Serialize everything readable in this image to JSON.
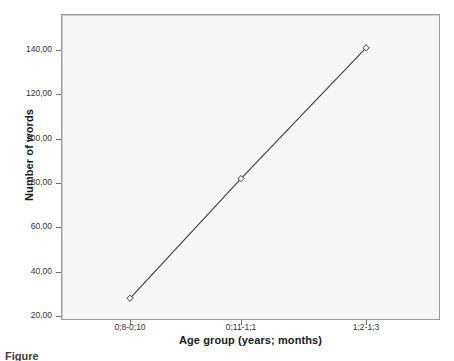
{
  "figure": {
    "background_color": "#ffffff",
    "plot_background_color": "#f7f7f7",
    "frame_color": "#9a9a9a",
    "series_color": "#3c3c3c",
    "caption_partial": "Figure"
  },
  "chart_data": {
    "type": "line",
    "title": "",
    "xlabel": "Age group (years; months)",
    "ylabel": "Number of words",
    "categories": [
      "0;8-0;10",
      "0;11-1;1",
      "1;2-1;3"
    ],
    "values": [
      28,
      82,
      141
    ],
    "ylim": [
      20,
      148
    ],
    "ytick_labels": [
      "20,00",
      "40,00",
      "60,00",
      "80,00",
      "100,00",
      "120,00",
      "140,00"
    ],
    "ytick_values": [
      20,
      40,
      60,
      80,
      100,
      120,
      140
    ],
    "grid": false,
    "legend": "none",
    "marker": "diamond",
    "series": [
      {
        "name": "Number of words",
        "values": [
          28,
          82,
          141
        ]
      }
    ]
  }
}
